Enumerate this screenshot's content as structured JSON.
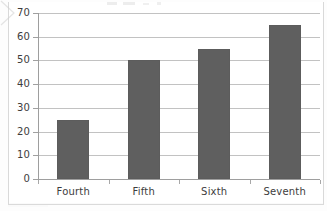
{
  "chart_data": {
    "type": "bar",
    "title": "",
    "subtitle": "",
    "xlabel": "",
    "ylabel": "",
    "categories": [
      "Fourth",
      "Fifth",
      "Sixth",
      "Seventh"
    ],
    "values": [
      25,
      50,
      55,
      65
    ],
    "series": [
      {
        "name": "",
        "values": [
          25,
          50,
          55,
          65
        ]
      }
    ],
    "ylim": [
      0,
      70
    ],
    "ytick_labels": [
      "0",
      "10",
      "20",
      "30",
      "40",
      "50",
      "60",
      "70"
    ],
    "ytick_values": [
      0,
      10,
      20,
      30,
      40,
      50,
      60,
      70
    ],
    "ytick_step": 10,
    "grid": true,
    "grid_axis": "y",
    "legend": false,
    "legend_position": "none",
    "bar_color": "#5f5f5f",
    "gridline_color": "#c2c2c2",
    "axis_color": "#9e9e9e",
    "background_color": "#ffffff",
    "label_color": "#3d3d3d",
    "annotations": []
  },
  "figure": {
    "name": "bar-chart",
    "frame_border_color": "#d9d9d9"
  }
}
